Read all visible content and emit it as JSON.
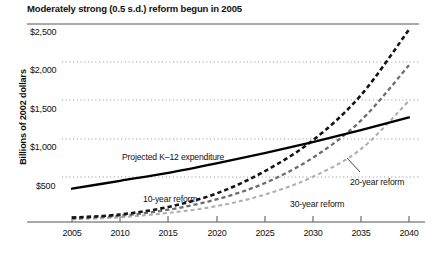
{
  "chart": {
    "title": "Moderately strong (0.5 s.d.) reform begun in 2005",
    "ylabel": "Billions of 2002 dollars",
    "y_ticks": [
      "$2,500",
      "$2,000",
      "$1,500",
      "$1,000",
      "$500"
    ],
    "x_ticks": [
      "2005",
      "2010",
      "2015",
      "2020",
      "2025",
      "2030",
      "2035",
      "2040"
    ],
    "annotations": {
      "projected": "Projected K–12 expenditure",
      "ten_year": "10-year reform",
      "twenty_year": "20-year reform",
      "thirty_year": "30-year reform"
    },
    "colors": {
      "projected": "#000000",
      "ten_year": "#141414",
      "twenty_year": "#6e6e6e",
      "thirty_year": "#b0b0b0",
      "grid": "#9a9a9a",
      "axis": "#555555"
    }
  },
  "chart_data": {
    "type": "line",
    "title": "Moderately strong (0.5 s.d.) reform begun in 2005",
    "xlabel": "",
    "ylabel": "Billions of 2002 dollars",
    "xlim": [
      2005,
      2040
    ],
    "ylim": [
      0,
      2500
    ],
    "ytick_values": [
      2500,
      2000,
      1500,
      1000,
      500
    ],
    "xtick_values": [
      2005,
      2010,
      2015,
      2020,
      2025,
      2030,
      2035,
      2040
    ],
    "grid": "horizontal-dotted",
    "legend": "inline-annotations",
    "x": [
      2005,
      2010,
      2015,
      2020,
      2025,
      2030,
      2035,
      2040
    ],
    "series": [
      {
        "name": "Projected K–12 expenditure",
        "style": "solid",
        "color": "#000000",
        "values": [
          420,
          520,
          620,
          740,
          870,
          1010,
          1160,
          1320
        ]
      },
      {
        "name": "10-year reform",
        "style": "dashed",
        "color": "#141414",
        "values": [
          55,
          95,
          190,
          360,
          640,
          1030,
          1600,
          2430
        ]
      },
      {
        "name": "20-year reform",
        "style": "dashed",
        "color": "#6e6e6e",
        "values": [
          45,
          80,
          155,
          285,
          490,
          810,
          1280,
          1980
        ]
      },
      {
        "name": "30-year reform",
        "style": "dashed",
        "color": "#b0b0b0",
        "values": [
          35,
          60,
          115,
          200,
          345,
          570,
          920,
          1530
        ]
      }
    ]
  }
}
